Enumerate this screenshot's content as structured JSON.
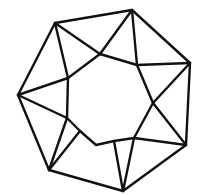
{
  "figure": {
    "stroke_color": "#111111",
    "stroke_width": 2.4,
    "background": "#ffffff",
    "outer_polygon": [
      [
        55,
        23
      ],
      [
        132,
        10
      ],
      [
        190,
        63
      ],
      [
        186,
        145
      ],
      [
        123,
        191
      ],
      [
        49,
        170
      ],
      [
        18,
        95
      ]
    ],
    "inner_polygon": [
      [
        68,
        78
      ],
      [
        100,
        54
      ],
      [
        137,
        65
      ],
      [
        153,
        103
      ],
      [
        134,
        138
      ],
      [
        114,
        141
      ],
      [
        96,
        145
      ],
      [
        80,
        131
      ],
      [
        67,
        118
      ]
    ],
    "spokes": [
      [
        [
          55,
          23
        ],
        [
          68,
          78
        ]
      ],
      [
        [
          55,
          23
        ],
        [
          100,
          54
        ]
      ],
      [
        [
          132,
          10
        ],
        [
          100,
          54
        ]
      ],
      [
        [
          132,
          10
        ],
        [
          137,
          65
        ]
      ],
      [
        [
          190,
          63
        ],
        [
          137,
          65
        ]
      ],
      [
        [
          190,
          63
        ],
        [
          153,
          103
        ]
      ],
      [
        [
          186,
          145
        ],
        [
          153,
          103
        ]
      ],
      [
        [
          186,
          145
        ],
        [
          134,
          138
        ]
      ],
      [
        [
          123,
          191
        ],
        [
          134,
          138
        ]
      ],
      [
        [
          123,
          191
        ],
        [
          114,
          141
        ]
      ],
      [
        [
          49,
          170
        ],
        [
          67,
          118
        ]
      ],
      [
        [
          49,
          170
        ],
        [
          80,
          131
        ]
      ],
      [
        [
          18,
          95
        ],
        [
          68,
          78
        ]
      ],
      [
        [
          18,
          95
        ],
        [
          67,
          118
        ]
      ]
    ]
  }
}
